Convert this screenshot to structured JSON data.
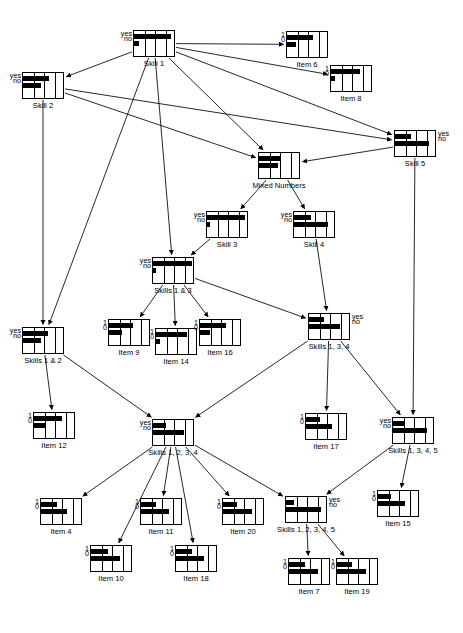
{
  "diagram": {
    "node_width": 42,
    "node_height": 27,
    "nodes": [
      {
        "id": "skill1",
        "label": "Skill 1",
        "type": "skill",
        "states": [
          "yes",
          "no"
        ],
        "states_side": "left",
        "x": 133,
        "y": 30,
        "bars": [
          0.88,
          0.12
        ]
      },
      {
        "id": "item6",
        "label": "Item 6",
        "type": "item",
        "states": [
          "1",
          "0"
        ],
        "states_side": "left",
        "x": 286,
        "y": 31,
        "bars": [
          0.62,
          0.22
        ]
      },
      {
        "id": "item8",
        "label": "Item 8",
        "type": "item",
        "states": [
          "1",
          "0"
        ],
        "states_side": "left",
        "x": 330,
        "y": 65,
        "bars": [
          0.7,
          0.1
        ]
      },
      {
        "id": "skill2",
        "label": "Skill 2",
        "type": "skill",
        "states": [
          "yes",
          "no"
        ],
        "states_side": "left",
        "x": 22,
        "y": 72,
        "bars": [
          0.62,
          0.42
        ]
      },
      {
        "id": "skill5",
        "label": "Skill 5",
        "type": "skill",
        "states": [
          "yes",
          "no"
        ],
        "states_side": "right",
        "x": 394,
        "y": 130,
        "bars": [
          0.38,
          0.8
        ]
      },
      {
        "id": "mixednumbers",
        "label": "Mixed Numbers",
        "type": "skill",
        "states": [
          "",
          ""
        ],
        "states_side": "none",
        "x": 258,
        "y": 152,
        "bars": [
          0.5,
          0.45
        ]
      },
      {
        "id": "skill3",
        "label": "Skill 3",
        "type": "skill",
        "states": [
          "yes",
          "no"
        ],
        "states_side": "left",
        "x": 206,
        "y": 211,
        "bars": [
          0.9,
          0.06
        ]
      },
      {
        "id": "skill4",
        "label": "Skill 4",
        "type": "skill",
        "states": [
          "yes",
          "no"
        ],
        "states_side": "left",
        "x": 293,
        "y": 211,
        "bars": [
          0.4,
          0.82
        ]
      },
      {
        "id": "skills13",
        "label": "Skills 1 & 3",
        "type": "skill",
        "states": [
          "yes",
          "no"
        ],
        "states_side": "left",
        "x": 152,
        "y": 257,
        "bars": [
          0.92,
          0.07
        ]
      },
      {
        "id": "item9",
        "label": "Item 9",
        "type": "item",
        "states": [
          "1",
          "0"
        ],
        "states_side": "left",
        "x": 108,
        "y": 319,
        "bars": [
          0.56,
          0.32
        ]
      },
      {
        "id": "item14",
        "label": "Item 14",
        "type": "item",
        "states": [
          "1",
          "0"
        ],
        "states_side": "left",
        "x": 155,
        "y": 328,
        "bars": [
          0.74,
          0.1
        ]
      },
      {
        "id": "item16",
        "label": "Item 16",
        "type": "item",
        "states": [
          "1",
          "0"
        ],
        "states_side": "left",
        "x": 199,
        "y": 319,
        "bars": [
          0.62,
          0.24
        ]
      },
      {
        "id": "skills134",
        "label": "Skills 1, 3, 4",
        "type": "skill",
        "states": [
          "yes",
          "no"
        ],
        "states_side": "right",
        "x": 308,
        "y": 313,
        "bars": [
          0.36,
          0.74
        ]
      },
      {
        "id": "skills12",
        "label": "Skills 1 & 2",
        "type": "skill",
        "states": [
          "yes",
          "no"
        ],
        "states_side": "left",
        "x": 22,
        "y": 327,
        "bars": [
          0.6,
          0.44
        ]
      },
      {
        "id": "item12",
        "label": "Item 12",
        "type": "item",
        "states": [
          "1",
          "0"
        ],
        "states_side": "left",
        "x": 33,
        "y": 412,
        "bars": [
          0.66,
          0.28
        ]
      },
      {
        "id": "skills1234",
        "label": "Skills 1, 2, 3, 4",
        "type": "skill",
        "states": [
          "yes",
          "no"
        ],
        "states_side": "left",
        "x": 152,
        "y": 419,
        "bars": [
          0.3,
          0.74
        ]
      },
      {
        "id": "item17",
        "label": "Item 17",
        "type": "item",
        "states": [
          "1",
          "0"
        ],
        "states_side": "left",
        "x": 305,
        "y": 413,
        "bars": [
          0.34,
          0.62
        ]
      },
      {
        "id": "skills1345",
        "label": "Skills 1, 3, 4, 5",
        "type": "skill",
        "states": [
          "yes",
          "no"
        ],
        "states_side": "left",
        "x": 392,
        "y": 417,
        "bars": [
          0.28,
          0.8
        ]
      },
      {
        "id": "item4",
        "label": "Item 4",
        "type": "item",
        "states": [
          "1",
          "0"
        ],
        "states_side": "left",
        "x": 40,
        "y": 498,
        "bars": [
          0.38,
          0.62
        ]
      },
      {
        "id": "item11",
        "label": "Item 11",
        "type": "item",
        "states": [
          "1",
          "0"
        ],
        "states_side": "left",
        "x": 140,
        "y": 498,
        "bars": [
          0.36,
          0.66
        ]
      },
      {
        "id": "item20",
        "label": "Item 20",
        "type": "item",
        "states": [
          "1",
          "0"
        ],
        "states_side": "left",
        "x": 222,
        "y": 498,
        "bars": [
          0.34,
          0.7
        ]
      },
      {
        "id": "skills12345",
        "label": "Skills 1, 2, 3, 4, 5",
        "type": "skill",
        "states": [
          "yes",
          "no"
        ],
        "states_side": "right",
        "x": 285,
        "y": 496,
        "bars": [
          0.18,
          0.84
        ]
      },
      {
        "id": "item15",
        "label": "Item 15",
        "type": "item",
        "states": [
          "1",
          "0"
        ],
        "states_side": "left",
        "x": 377,
        "y": 490,
        "bars": [
          0.3,
          0.64
        ]
      },
      {
        "id": "item10",
        "label": "Item 10",
        "type": "item",
        "states": [
          "1",
          "0"
        ],
        "states_side": "left",
        "x": 90,
        "y": 545,
        "bars": [
          0.4,
          0.7
        ]
      },
      {
        "id": "item18",
        "label": "Item 18",
        "type": "item",
        "states": [
          "1",
          "0"
        ],
        "states_side": "left",
        "x": 175,
        "y": 545,
        "bars": [
          0.38,
          0.66
        ]
      },
      {
        "id": "item7",
        "label": "Item 7",
        "type": "item",
        "states": [
          "1",
          "0"
        ],
        "states_side": "left",
        "x": 288,
        "y": 558,
        "bars": [
          0.38,
          0.68
        ]
      },
      {
        "id": "item19",
        "label": "Item 19",
        "type": "item",
        "states": [
          "1",
          "0"
        ],
        "states_side": "left",
        "x": 336,
        "y": 558,
        "bars": [
          0.36,
          0.7
        ]
      }
    ],
    "edges": [
      {
        "from": "skill1",
        "to": "item6"
      },
      {
        "from": "skill1",
        "to": "item8"
      },
      {
        "from": "skill1",
        "to": "skill2"
      },
      {
        "from": "skill1",
        "to": "skill5"
      },
      {
        "from": "skill1",
        "to": "mixednumbers"
      },
      {
        "from": "skill1",
        "to": "skills13"
      },
      {
        "from": "skill1",
        "to": "skills12"
      },
      {
        "from": "skill2",
        "to": "mixednumbers"
      },
      {
        "from": "skill2",
        "to": "skill5"
      },
      {
        "from": "skill2",
        "to": "skills12"
      },
      {
        "from": "skill5",
        "to": "mixednumbers"
      },
      {
        "from": "skill5",
        "to": "skills1345"
      },
      {
        "from": "mixednumbers",
        "to": "skill3"
      },
      {
        "from": "mixednumbers",
        "to": "skill4"
      },
      {
        "from": "skill3",
        "to": "skills13"
      },
      {
        "from": "skill4",
        "to": "skills134"
      },
      {
        "from": "skills13",
        "to": "item9"
      },
      {
        "from": "skills13",
        "to": "item14"
      },
      {
        "from": "skills13",
        "to": "item16"
      },
      {
        "from": "skills13",
        "to": "skills134"
      },
      {
        "from": "skills12",
        "to": "item12"
      },
      {
        "from": "skills12",
        "to": "skills1234"
      },
      {
        "from": "skills134",
        "to": "item17"
      },
      {
        "from": "skills134",
        "to": "skills1234"
      },
      {
        "from": "skills134",
        "to": "skills1345"
      },
      {
        "from": "skills1345",
        "to": "item15"
      },
      {
        "from": "skills1345",
        "to": "skills12345"
      },
      {
        "from": "skills1234",
        "to": "item4"
      },
      {
        "from": "skills1234",
        "to": "item11"
      },
      {
        "from": "skills1234",
        "to": "item20"
      },
      {
        "from": "skills1234",
        "to": "item10"
      },
      {
        "from": "skills1234",
        "to": "item18"
      },
      {
        "from": "skills1234",
        "to": "skills12345"
      },
      {
        "from": "skills12345",
        "to": "item7"
      },
      {
        "from": "skills12345",
        "to": "item19"
      }
    ]
  }
}
